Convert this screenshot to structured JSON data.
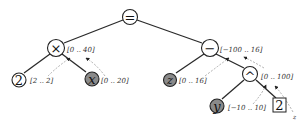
{
  "diagram": {
    "type": "expression-tree",
    "nodes": {
      "eq": {
        "symbol": "=",
        "kind": "operator"
      },
      "mul": {
        "symbol": "×",
        "kind": "operator",
        "interval": "[0 .. 40]"
      },
      "two_left": {
        "symbol": "2",
        "kind": "constant",
        "interval": "[2 .. 2]"
      },
      "x": {
        "symbol": "x",
        "kind": "variable",
        "interval": "[0 .. 20]"
      },
      "minus": {
        "symbol": "−",
        "kind": "operator",
        "interval": "[−100 .. 16]"
      },
      "z": {
        "symbol": "z",
        "kind": "variable",
        "interval": "[0 .. 16]"
      },
      "pow": {
        "symbol": "^",
        "kind": "operator",
        "interval": "[0 .. 100]"
      },
      "y": {
        "symbol": "y",
        "kind": "variable",
        "interval": "[−10 .. 10]"
      },
      "two_right": {
        "symbol": "2",
        "kind": "constant-boxed"
      }
    },
    "corner_label": "z",
    "colors": {
      "edge": "#2a2a2a",
      "variable_fill": "#8a8a8a",
      "arrow": "#9a9a9a"
    }
  }
}
